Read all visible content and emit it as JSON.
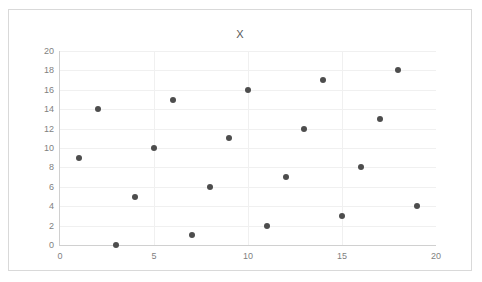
{
  "chart_data": {
    "type": "scatter",
    "title": "X",
    "xlabel": "",
    "ylabel": "",
    "xlim": [
      0,
      20
    ],
    "ylim": [
      0,
      20
    ],
    "xticks": [
      0,
      5,
      10,
      15,
      20
    ],
    "yticks": [
      0,
      2,
      4,
      6,
      8,
      10,
      12,
      14,
      16,
      18,
      20
    ],
    "grid": "horizontal-and-vertical",
    "legend": "none",
    "series": [
      {
        "name": "X",
        "marker": "circle",
        "color": "#4d4d4d",
        "points": [
          {
            "x": 1,
            "y": 9
          },
          {
            "x": 2,
            "y": 14
          },
          {
            "x": 3,
            "y": 0
          },
          {
            "x": 4,
            "y": 5
          },
          {
            "x": 5,
            "y": 10
          },
          {
            "x": 6,
            "y": 15
          },
          {
            "x": 7,
            "y": 1
          },
          {
            "x": 8,
            "y": 6
          },
          {
            "x": 9,
            "y": 11
          },
          {
            "x": 10,
            "y": 16
          },
          {
            "x": 11,
            "y": 2
          },
          {
            "x": 12,
            "y": 7
          },
          {
            "x": 13,
            "y": 12
          },
          {
            "x": 14,
            "y": 17
          },
          {
            "x": 15,
            "y": 3
          },
          {
            "x": 16,
            "y": 8
          },
          {
            "x": 17,
            "y": 13
          },
          {
            "x": 18,
            "y": 18
          },
          {
            "x": 19,
            "y": 4
          }
        ]
      }
    ]
  },
  "colors": {
    "marker": "#4d4d4d",
    "gridline": "#f0f0f0",
    "axis": "#d0d0d0",
    "tick_label": "#7f7f7f",
    "title": "#595959",
    "frame_border": "#d9d9d9"
  }
}
